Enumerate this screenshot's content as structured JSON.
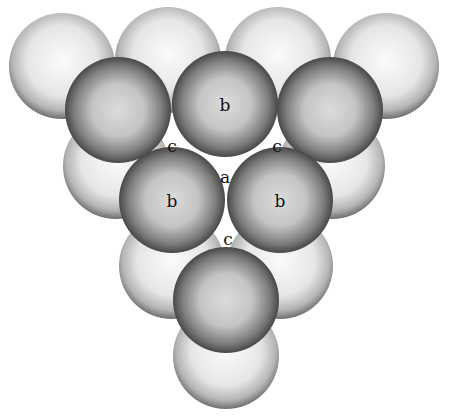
{
  "colors": {
    "background": "#ffffff",
    "lower_layer_light": "#f2f2f2",
    "lower_layer_rim": "#6e6e6e",
    "upper_layer_light": "#d4d4d4",
    "upper_layer_rim": "#2a2a2a",
    "label": "#111111"
  },
  "radius": 53,
  "lower_layer": [
    {
      "x": 62,
      "y": 66
    },
    {
      "x": 168,
      "y": 60
    },
    {
      "x": 278,
      "y": 60
    },
    {
      "x": 386,
      "y": 66
    },
    {
      "x": 116,
      "y": 166
    },
    {
      "x": 332,
      "y": 166
    },
    {
      "x": 172,
      "y": 266
    },
    {
      "x": 280,
      "y": 266
    },
    {
      "x": 226,
      "y": 356
    }
  ],
  "upper_layer": [
    {
      "x": 118,
      "y": 110,
      "label": ""
    },
    {
      "x": 225,
      "y": 104,
      "label": "b"
    },
    {
      "x": 330,
      "y": 110,
      "label": ""
    },
    {
      "x": 172,
      "y": 200,
      "label": "b"
    },
    {
      "x": 280,
      "y": 200,
      "label": "b"
    },
    {
      "x": 226,
      "y": 300,
      "label": ""
    }
  ],
  "site_labels": [
    {
      "text": "c",
      "x": 172,
      "y": 147
    },
    {
      "text": "c",
      "x": 277,
      "y": 147
    },
    {
      "text": "a",
      "x": 225,
      "y": 178
    },
    {
      "text": "c",
      "x": 228,
      "y": 240
    }
  ]
}
